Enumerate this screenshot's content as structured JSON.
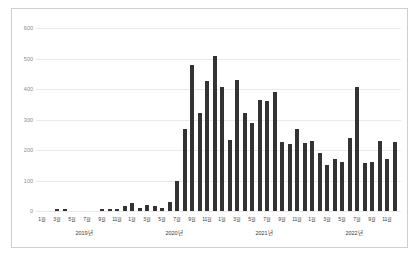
{
  "chart_data": {
    "type": "bar",
    "title": "",
    "xlabel": "",
    "ylabel": "",
    "ylim": [
      0,
      600
    ],
    "yticks": [
      0,
      100,
      200,
      300,
      400,
      500,
      600
    ],
    "grid": true,
    "legend": false,
    "bar_color": "#333333",
    "month_tick_labels": [
      "1월",
      "3월",
      "5월",
      "7월",
      "9월",
      "11월"
    ],
    "years": [
      {
        "label": "2019년",
        "values": [
          0,
          0,
          6,
          6,
          0,
          0,
          0,
          0,
          5,
          5,
          5,
          15
        ]
      },
      {
        "label": "2020년",
        "values": [
          25,
          10,
          20,
          15,
          10,
          30,
          100,
          270,
          480,
          322,
          427,
          508
        ]
      },
      {
        "label": "2021년",
        "values": [
          405,
          232,
          430,
          320,
          290,
          363,
          360,
          390,
          226,
          220,
          270,
          222
        ]
      },
      {
        "label": "2022년",
        "values": [
          230,
          190,
          150,
          170,
          160,
          240,
          405,
          158,
          162,
          228,
          170,
          225
        ]
      }
    ]
  },
  "colors": {
    "bar": "#333333",
    "gridline": "#e9e9e9",
    "y_tick_text": "#8a8a8a",
    "x_tick_text": "#3a3a3a",
    "panel_border": "#cfcfcf",
    "background": "#ffffff"
  }
}
